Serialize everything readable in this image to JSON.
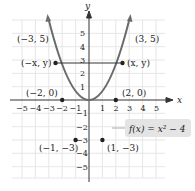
{
  "figure": {
    "function_label": "f(x) = x² − 4",
    "axis_x": "x",
    "axis_y": "y",
    "x_ticks": [
      "−5",
      "−4",
      "−3",
      "−2",
      "−1",
      "1",
      "2",
      "3",
      "4",
      "5"
    ],
    "y_ticks": [
      "5",
      "4",
      "3",
      "2",
      "1",
      "−1",
      "−2",
      "−3",
      "−4",
      "−5"
    ],
    "points": [
      {
        "label": "(−3, 5)",
        "x": -3,
        "y": 5
      },
      {
        "label": "(3, 5)",
        "x": 3,
        "y": 5
      },
      {
        "label": "(−x, y)",
        "x": -2.6,
        "y": 2.76
      },
      {
        "label": "(x, y)",
        "x": 2.6,
        "y": 2.76
      },
      {
        "label": "(−2, 0)",
        "x": -2,
        "y": 0
      },
      {
        "label": "(2, 0)",
        "x": 2,
        "y": 0
      },
      {
        "label": "(−1, −3)",
        "x": -1,
        "y": -3
      },
      {
        "label": "(1, −3)",
        "x": 1,
        "y": -3
      }
    ],
    "colors": {
      "curve": "#6b6b6b",
      "grid": "#dcdcdc",
      "label_box": "#e4e4e4"
    }
  }
}
